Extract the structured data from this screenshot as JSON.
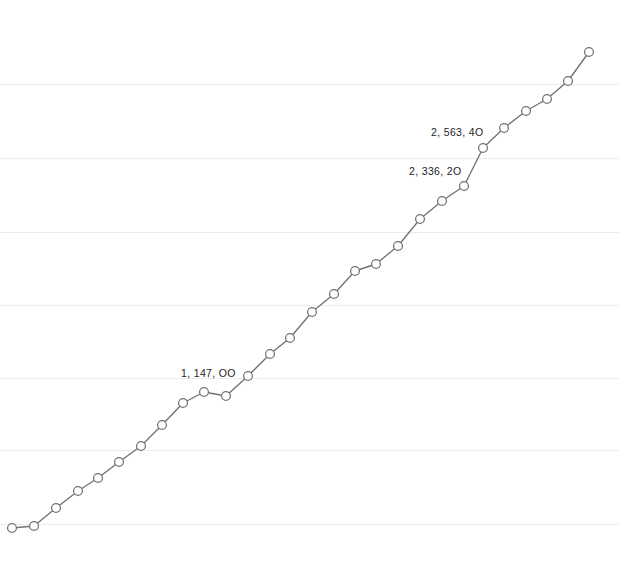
{
  "chart_data": {
    "type": "line",
    "title": "",
    "subtitle": "",
    "xlabel": "",
    "ylabel": "",
    "grid": true,
    "legend": false,
    "legend_position": "none",
    "background_color": "#ffffff",
    "line_color": "#6f7276",
    "marker_color": "#6f7276",
    "marker_fill": "#ffffff",
    "gridline_color": "#ececec",
    "label_color": "#1d1d1f",
    "xlim": [
      0,
      27
    ],
    "ylim": [
      0,
      2800
    ],
    "x_tick_labels": [],
    "y_tick_labels": [],
    "gridline_y_pixels": [
      84,
      158,
      232,
      305,
      378,
      450,
      524
    ],
    "series": [
      {
        "name": "series-1",
        "x": [
          0,
          1,
          2,
          3,
          4,
          5,
          6,
          7,
          8,
          9,
          10,
          11,
          12,
          13,
          14,
          15,
          16,
          17,
          18,
          19,
          20,
          21,
          22,
          23,
          24,
          25,
          26,
          27
        ],
        "points_px": [
          [
            12,
            528
          ],
          [
            34,
            526
          ],
          [
            56,
            508
          ],
          [
            78,
            491
          ],
          [
            98,
            478
          ],
          [
            119,
            462
          ],
          [
            141,
            446
          ],
          [
            162,
            425
          ],
          [
            183,
            403
          ],
          [
            204,
            392
          ],
          [
            226,
            396
          ],
          [
            248,
            376
          ],
          [
            270,
            354
          ],
          [
            290,
            338
          ],
          [
            312,
            312
          ],
          [
            334,
            294
          ],
          [
            355,
            271
          ],
          [
            376,
            264
          ],
          [
            398,
            246
          ],
          [
            420,
            219
          ],
          [
            442,
            201
          ],
          [
            464,
            186
          ],
          [
            483,
            148
          ],
          [
            504,
            128
          ],
          [
            526,
            111
          ],
          [
            547,
            99
          ],
          [
            568,
            81
          ],
          [
            589,
            52
          ]
        ],
        "values": [
          320,
          330,
          400,
          470,
          520,
          585,
          650,
          735,
          825,
          870,
          855,
          935,
          1025,
          1085,
          1190,
          1265,
          1355,
          1385,
          1460,
          1570,
          1645,
          1705,
          1860,
          1940,
          2010,
          2060,
          2135,
          2250
        ]
      }
    ],
    "annotations": [
      {
        "name": "label-1147",
        "text": "1, 147, OO",
        "point_index": 9,
        "x_px": 181,
        "y_px": 368
      },
      {
        "name": "label-2336",
        "text": "2, 336, 2O",
        "point_index": 21,
        "x_px": 409,
        "y_px": 166
      },
      {
        "name": "label-2563",
        "text": "2, 563, 4O",
        "point_index": 22,
        "x_px": 431,
        "y_px": 127
      }
    ]
  }
}
